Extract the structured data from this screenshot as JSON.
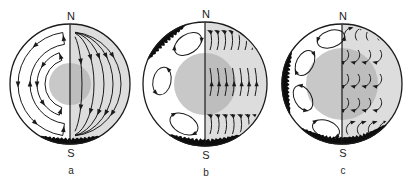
{
  "figure": {
    "background": "#ffffff",
    "ink": "#1a1a1a",
    "panels": [
      {
        "label": "a",
        "pole_top": "N",
        "pole_bottom": "S",
        "cx": 70,
        "cy": 84,
        "r": 60,
        "core": {
          "r": 21,
          "color": "#c8c8c8"
        },
        "right_half": {
          "type": "poloidal-field-lines",
          "fill": "#e9e9e9",
          "line_rx": [
            12,
            24,
            34,
            43,
            51
          ],
          "line_ry": 52,
          "arrow_fracs": [
            0.3,
            0.7
          ]
        },
        "left_half": {
          "type": "meridional-circulation-loops",
          "loops": [
            {
              "ro": 52,
              "ri": 40,
              "a1": 262,
              "a2": 98,
              "outer_arrows": [
                228,
                180,
                132
              ],
              "inner_arrows": [
                180
              ]
            },
            {
              "ro": 33,
              "ri": 25,
              "a1": 251,
              "a2": 109,
              "outer_arrows": [
                215,
                180,
                145
              ],
              "inner_arrows": []
            }
          ]
        },
        "dark_rim_bands": [
          {
            "a1": 60,
            "a2": 120,
            "depth": 6
          }
        ]
      },
      {
        "label": "b",
        "pole_top": "N",
        "pole_bottom": "S",
        "cx": 205,
        "cy": 84,
        "r": 62,
        "core": {
          "r": 31,
          "color": "#c8c8c8"
        },
        "right_half": {
          "type": "banded-toroidal-field",
          "fill": "#e9e9e9",
          "bands": [
            {
              "y0": -54,
              "h": 20,
              "n": 8,
              "x0": 5,
              "dx": 7,
              "arrow": "top",
              "arrow_angle": 207
            },
            {
              "y0": -16,
              "h": 28,
              "n": 7,
              "x0": 5,
              "dx": 7.5,
              "arrow": "mid",
              "arrow_angle": 268
            },
            {
              "y0": 30,
              "h": 20,
              "n": 7,
              "x0": 5,
              "dx": 7.5,
              "arrow": "top",
              "arrow_angle": 203
            }
          ]
        },
        "left_half": {
          "type": "convection-cells",
          "cells": [
            {
              "x": -17,
              "y": -40,
              "rx": 15,
              "ry": 9.5,
              "rot": -33,
              "sense": "cw"
            },
            {
              "x": -43,
              "y": -3,
              "rx": 14,
              "ry": 9,
              "rot": -78,
              "sense": "ccw"
            },
            {
              "x": -21,
              "y": 40,
              "rx": 15,
              "ry": 9.5,
              "rot": 28,
              "sense": "cw"
            }
          ]
        },
        "dark_rim_bands": [
          {
            "a1": 203,
            "a2": 252,
            "depth": 6
          },
          {
            "a1": 55,
            "a2": 126,
            "depth": 7
          }
        ]
      },
      {
        "label": "c",
        "pole_top": "N",
        "pole_bottom": "S",
        "cx": 342,
        "cy": 84,
        "r": 60,
        "core": {
          "r": 36,
          "color": "#c8c8c8"
        },
        "right_half": {
          "type": "tangled-field-hooks",
          "fill": "#e9e9e9",
          "rows": [
            {
              "y": -56,
              "x0": 4,
              "dx": 11,
              "n": 4,
              "dirn": "up"
            },
            {
              "y": -34,
              "x0": 5,
              "dx": 11,
              "n": 4,
              "dirn": "down"
            },
            {
              "y": -10,
              "x0": 5,
              "dx": 11,
              "n": 4,
              "dirn": "down"
            },
            {
              "y": 14,
              "x0": 5,
              "dx": 11,
              "n": 4,
              "dirn": "down"
            },
            {
              "y": 38,
              "x0": 6,
              "dx": 11,
              "n": 4,
              "dirn": "up"
            }
          ]
        },
        "left_half": {
          "type": "convection-cells",
          "cells": [
            {
              "x": -11,
              "y": -45,
              "rx": 14,
              "ry": 8.5,
              "rot": -18,
              "sense": "ccw"
            },
            {
              "x": -37,
              "y": -21,
              "rx": 13.5,
              "ry": 8.5,
              "rot": -62,
              "sense": "cw"
            },
            {
              "x": -39,
              "y": 14,
              "rx": 13.5,
              "ry": 8.5,
              "rot": 62,
              "sense": "ccw"
            },
            {
              "x": -16,
              "y": 45,
              "rx": 14,
              "ry": 8.5,
              "rot": 20,
              "sense": "cw"
            }
          ]
        },
        "dark_rim_bands": [
          {
            "a1": 150,
            "a2": 213,
            "depth": 7
          },
          {
            "a1": 42,
            "a2": 133,
            "depth": 7
          }
        ]
      }
    ]
  }
}
